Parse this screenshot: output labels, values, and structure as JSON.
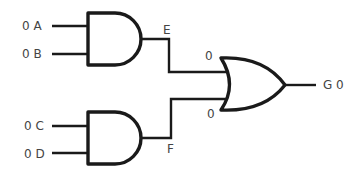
{
  "diagram": {
    "type": "logic-circuit",
    "inputs": [
      {
        "name": "A",
        "value": "0",
        "label": "0 A"
      },
      {
        "name": "B",
        "value": "0",
        "label": "0 B"
      },
      {
        "name": "C",
        "value": "0",
        "label": "0 C"
      },
      {
        "name": "D",
        "value": "0",
        "label": "0 D"
      }
    ],
    "gates": [
      {
        "id": "and1",
        "type": "AND",
        "inputs": [
          "A",
          "B"
        ],
        "output": "E"
      },
      {
        "id": "and2",
        "type": "AND",
        "inputs": [
          "C",
          "D"
        ],
        "output": "F"
      },
      {
        "id": "or1",
        "type": "OR",
        "inputs": [
          "E",
          "F"
        ],
        "output": "G"
      }
    ],
    "intermediate": {
      "E": {
        "label": "E"
      },
      "F": {
        "label": "F"
      },
      "or_in_top": "0",
      "or_in_bottom": "0"
    },
    "output": {
      "name": "G",
      "value": "0",
      "label": "G 0"
    },
    "colors": {
      "stroke": "#1a1a1a",
      "text": "#444444",
      "background": "#ffffff"
    }
  }
}
